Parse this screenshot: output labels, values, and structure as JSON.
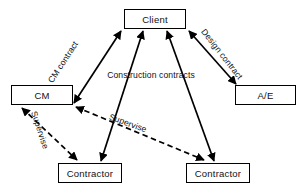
{
  "diagram": {
    "canvas": {
      "width": 304,
      "height": 193,
      "background": "#ffffff"
    },
    "line_color": "#000000",
    "nodes": [
      {
        "id": "client",
        "label": "Client",
        "x": 124,
        "y": 9,
        "w": 62,
        "h": 20
      },
      {
        "id": "cm",
        "label": "CM",
        "x": 11,
        "y": 85,
        "w": 62,
        "h": 20
      },
      {
        "id": "ae",
        "label": "A/E",
        "x": 235,
        "y": 85,
        "w": 61,
        "h": 20
      },
      {
        "id": "contractor1",
        "label": "Contractor",
        "x": 58,
        "y": 163,
        "w": 64,
        "h": 20
      },
      {
        "id": "contractor2",
        "label": "Contractor",
        "x": 186,
        "y": 163,
        "w": 64,
        "h": 20
      }
    ],
    "edges": [
      {
        "id": "cm-contract",
        "from": "cm",
        "to": "client",
        "style": "solid",
        "arrows": "both",
        "label": "CM contract"
      },
      {
        "id": "design-contract",
        "from": "client",
        "to": "ae",
        "style": "solid",
        "arrows": "both",
        "label": "Design contract"
      },
      {
        "id": "construction-contract-1",
        "from": "client",
        "to": "contractor1",
        "style": "solid",
        "arrows": "both",
        "label": "Construction contracts"
      },
      {
        "id": "construction-contract-2",
        "from": "client",
        "to": "contractor2",
        "style": "solid",
        "arrows": "both",
        "label": ""
      },
      {
        "id": "supervise-1",
        "from": "cm",
        "to": "contractor1",
        "style": "dashed",
        "arrows": "both",
        "label": "Supervise"
      },
      {
        "id": "supervise-2",
        "from": "cm",
        "to": "contractor2",
        "style": "dashed",
        "arrows": "both",
        "label": "Supervise"
      }
    ],
    "labels": {
      "cm_contract": "CM contract",
      "design_contract": "Design contract",
      "construction_contracts": "Construction contracts",
      "supervise_left": "Supervise",
      "supervise_right": "Supervise"
    }
  }
}
